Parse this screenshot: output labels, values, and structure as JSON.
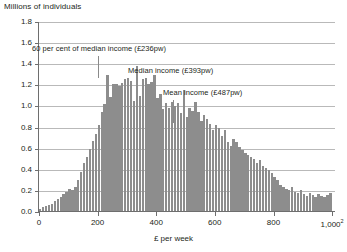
{
  "chart_data": {
    "type": "bar",
    "title": "",
    "subtitle": "",
    "ylabel": "Millions of individuals",
    "xlabel": "£ per week",
    "xlabel_footnote": "2",
    "xlim": [
      0,
      1010
    ],
    "ylim": [
      0.0,
      1.8
    ],
    "grid": true,
    "legend_position": "none",
    "bin_width": 10,
    "y_ticks": [
      "0.0",
      "0.2",
      "0.4",
      "0.6",
      "0.8",
      "1.0",
      "1.2",
      "1.4",
      "1.6",
      "1.8"
    ],
    "y_tick_values": [
      0.0,
      0.2,
      0.4,
      0.6,
      0.8,
      1.0,
      1.2,
      1.4,
      1.6,
      1.8
    ],
    "x_ticks": [
      "0",
      "200",
      "400",
      "600",
      "800",
      "1,000"
    ],
    "x_tick_values": [
      0,
      200,
      400,
      600,
      800,
      1000
    ],
    "bar_color": "#8d8d8d",
    "axis_color": "#6e6e6e",
    "grid_color": "#b9b9b9",
    "x": [
      5,
      15,
      25,
      35,
      45,
      55,
      65,
      75,
      85,
      95,
      105,
      115,
      125,
      135,
      145,
      155,
      165,
      175,
      185,
      195,
      205,
      215,
      225,
      235,
      245,
      255,
      265,
      275,
      285,
      295,
      305,
      315,
      325,
      335,
      345,
      355,
      365,
      375,
      385,
      395,
      405,
      415,
      425,
      435,
      445,
      455,
      465,
      475,
      485,
      495,
      505,
      515,
      525,
      535,
      545,
      555,
      565,
      575,
      585,
      595,
      605,
      615,
      625,
      635,
      645,
      655,
      665,
      675,
      685,
      695,
      705,
      715,
      725,
      735,
      745,
      755,
      765,
      775,
      785,
      795,
      805,
      815,
      825,
      835,
      845,
      855,
      865,
      875,
      885,
      895,
      905,
      915,
      925,
      935,
      945,
      955,
      965,
      975,
      985,
      995
    ],
    "values": [
      0.03,
      0.05,
      0.06,
      0.07,
      0.08,
      0.1,
      0.12,
      0.14,
      0.17,
      0.19,
      0.22,
      0.21,
      0.24,
      0.3,
      0.38,
      0.46,
      0.52,
      0.6,
      0.67,
      0.74,
      0.82,
      0.95,
      1.02,
      1.3,
      1.09,
      1.21,
      1.21,
      1.19,
      1.22,
      1.26,
      1.27,
      1.24,
      1.05,
      1.38,
      1.1,
      1.26,
      1.27,
      1.21,
      1.23,
      1.3,
      1.08,
      1.12,
      0.98,
      1.03,
      0.99,
      1.04,
      1.0,
      1.03,
      0.94,
      1.16,
      0.9,
      0.99,
      0.96,
      1.04,
      0.95,
      0.86,
      0.92,
      0.88,
      0.83,
      0.78,
      0.82,
      0.8,
      0.72,
      0.78,
      0.66,
      0.63,
      0.69,
      0.66,
      0.62,
      0.59,
      0.56,
      0.54,
      0.52,
      0.5,
      0.46,
      0.49,
      0.44,
      0.42,
      0.4,
      0.37,
      0.33,
      0.3,
      0.26,
      0.24,
      0.22,
      0.21,
      0.24,
      0.19,
      0.18,
      0.21,
      0.17,
      0.15,
      0.18,
      0.16,
      0.14,
      0.17,
      0.15,
      0.14,
      0.16,
      0.18
    ],
    "annotations": [
      {
        "id": "sixty-per-cent-median",
        "label": "60 per cent of median income (£236pw)",
        "x_value": 236,
        "label_x_px": 32,
        "label_y_px": 44,
        "rule_x_px": 98,
        "rule_top_px": 56,
        "rule_height_px": 22
      },
      {
        "id": "median-income",
        "label": "Median income (£393pw)",
        "x_value": 393,
        "label_x_px": 128,
        "label_y_px": 66,
        "rule_x_px": 145,
        "rule_top_px": 78,
        "rule_height_px": 22
      },
      {
        "id": "mean-income",
        "label": "Mean income (£487pw)",
        "x_value": 487,
        "label_x_px": 163,
        "label_y_px": 88,
        "rule_x_px": 173,
        "rule_top_px": 100,
        "rule_height_px": 23
      }
    ]
  }
}
